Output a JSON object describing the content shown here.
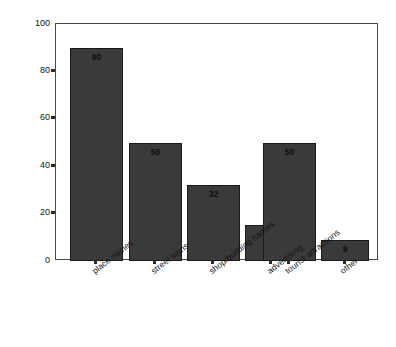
{
  "chart_data": {
    "type": "bar",
    "title": "",
    "subtitle": "",
    "xlabel": "",
    "ylabel": "Percentage",
    "ylim": [
      0,
      100
    ],
    "yticks": [
      0,
      20,
      40,
      60,
      80,
      100
    ],
    "ytick_labels": [
      "0",
      "20",
      "40",
      "60",
      "80",
      "100"
    ],
    "grid": false,
    "legend": null,
    "bar_color": "#3a3a3a",
    "bar_edge_color": "#1a1a1a",
    "axis_color": "#4a4a4a",
    "background_color": "#ffffff",
    "categories": [
      "place names",
      "street signs",
      "shop/building names",
      "advertising",
      "tourist attractions",
      "other"
    ],
    "values": [
      90,
      50,
      32,
      15,
      50,
      9
    ],
    "value_labels": [
      "90",
      "50",
      "32",
      "15",
      "50",
      "9"
    ],
    "bars": [
      {
        "category": "place names",
        "value": 90,
        "label": "90"
      },
      {
        "category": "street signs",
        "value": 50,
        "label": "50"
      },
      {
        "category": "shop/building names",
        "value": 32,
        "label": "32"
      },
      {
        "category": "advertising",
        "value": 15,
        "label": "15"
      },
      {
        "category": "tourist attractions",
        "value": 50,
        "label": "50"
      },
      {
        "category": "other",
        "value": 9,
        "label": "9"
      }
    ]
  }
}
